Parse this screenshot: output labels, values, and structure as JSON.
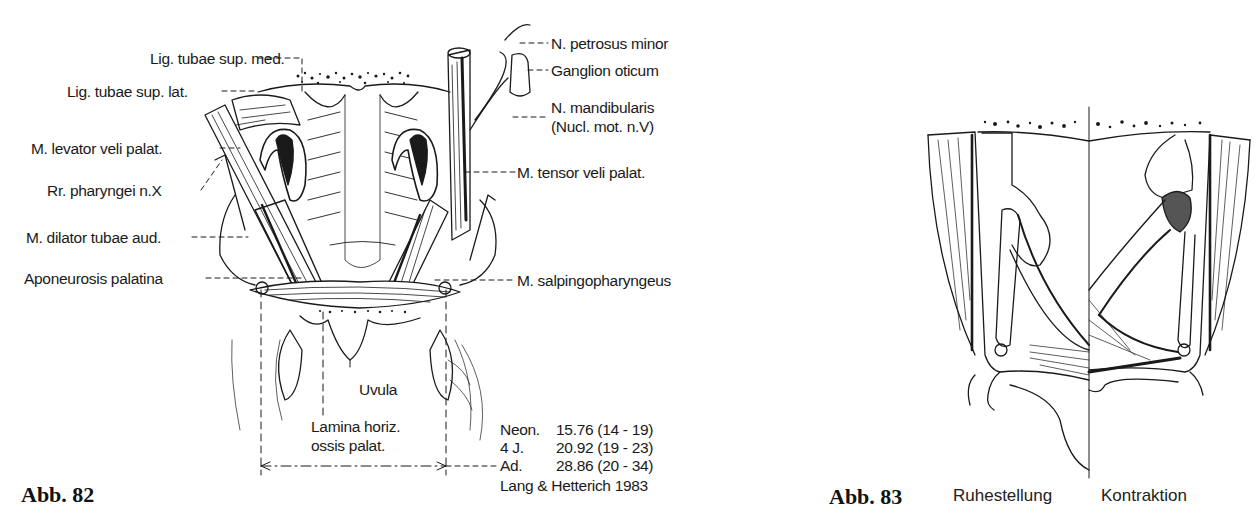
{
  "figure82": {
    "caption": "Abb. 82",
    "labels_left": [
      {
        "id": "lig-tubae-sup-med",
        "text": "Lig. tubae sup. med."
      },
      {
        "id": "lig-tubae-sup-lat",
        "text": "Lig. tubae sup. lat."
      },
      {
        "id": "m-levator-veli-palat",
        "text": "M. levator veli palat."
      },
      {
        "id": "rr-pharyngei",
        "text": "Rr. pharyngei n.X"
      },
      {
        "id": "m-dilator-tubae-aud",
        "text": "M. dilator tubae aud."
      },
      {
        "id": "aponeurosis-palatina",
        "text": "Aponeurosis palatina"
      }
    ],
    "labels_right": [
      {
        "id": "n-petrosus-minor",
        "text": "N. petrosus minor"
      },
      {
        "id": "ganglion-oticum",
        "text": "Ganglion oticum"
      },
      {
        "id": "n-mandibularis",
        "text": "N. mandibularis"
      },
      {
        "id": "nucl-mot",
        "text": "(Nucl. mot. n.V)"
      },
      {
        "id": "m-tensor-veli-palat",
        "text": "M. tensor veli palat."
      },
      {
        "id": "m-salpingopharyngeus",
        "text": "M. salpingopharyngeus"
      }
    ],
    "labels_bottom": {
      "uvula": "Uvula",
      "lamina_line1": "Lamina horiz.",
      "lamina_line2": "ossis palat."
    },
    "measurements": [
      {
        "group": "Neon.",
        "value": "15.76 (14 - 19)"
      },
      {
        "group": "4 J.",
        "value": "20.92 (19 - 23)"
      },
      {
        "group": "Ad.",
        "value": "28.86 (20 - 34)"
      }
    ],
    "source": "Lang & Hetterich 1983"
  },
  "figure83": {
    "caption": "Abb. 83",
    "left_state": "Ruhestellung",
    "right_state": "Kontraktion"
  }
}
